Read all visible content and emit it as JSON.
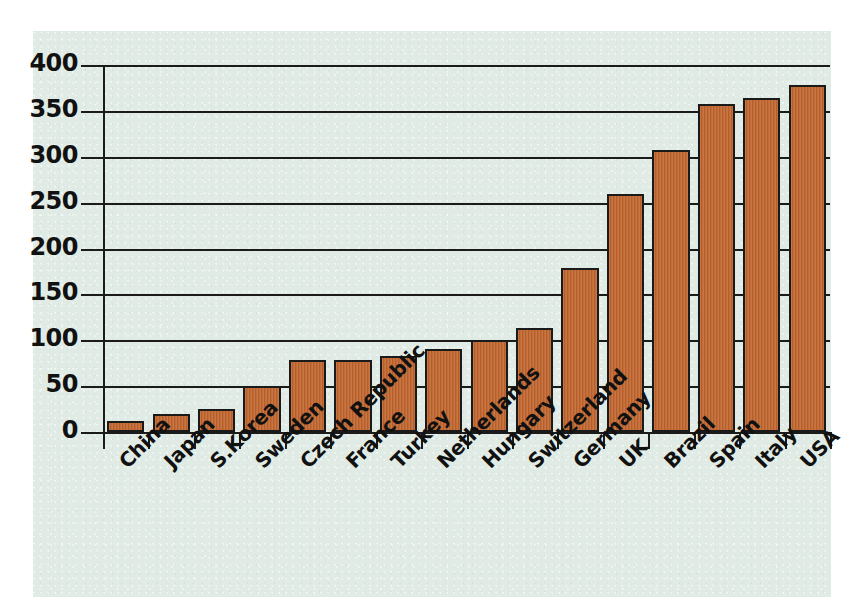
{
  "chart_data": {
    "type": "bar",
    "title": "",
    "subtitle": "",
    "xlabel": "",
    "ylabel": "",
    "ylim": [
      0,
      400
    ],
    "yticks": [
      0,
      50,
      100,
      150,
      200,
      250,
      300,
      350,
      400
    ],
    "ytick_labels": [
      "0",
      "50",
      "100",
      "150",
      "200",
      "250",
      "300",
      "350",
      "400"
    ],
    "grid": true,
    "legend": "none",
    "categories": [
      "China",
      "Japan",
      "S.Korea",
      "Sweden",
      "Czech Republic",
      "France",
      "Turkey",
      "Netherlands",
      "Hungary",
      "Switzerland",
      "Germany",
      "UK",
      "Brazil",
      "Spain",
      "Italy",
      "USA"
    ],
    "values": [
      12,
      20,
      25,
      50,
      79,
      79,
      83,
      91,
      100,
      113,
      179,
      259,
      307,
      357,
      364,
      378
    ],
    "series": [
      {
        "name": "value",
        "values": [
          12,
          20,
          25,
          50,
          79,
          79,
          83,
          91,
          100,
          113,
          179,
          259,
          307,
          357,
          364,
          378
        ]
      }
    ],
    "colors": {
      "bar_fill": "#C1662F",
      "bar_edge": "#1A1A1A",
      "panel_background": "#DFEBE4",
      "figure_background": "#FFFFFF",
      "axis": "#1B1B1B",
      "text": "#111111"
    }
  }
}
